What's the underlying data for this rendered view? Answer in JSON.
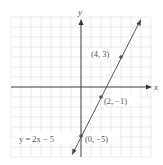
{
  "chart_data": {
    "type": "line",
    "title": "",
    "xlabel": "x",
    "ylabel": "y",
    "xlim": [
      -7,
      7
    ],
    "ylim": [
      -7,
      7
    ],
    "grid": true,
    "series": [
      {
        "name": "y = 2x − 5",
        "equation": "y = 2x − 5",
        "slope": 2,
        "intercept": -5,
        "x": [
          -0.9,
          6
        ],
        "y": [
          -6.8,
          7
        ]
      }
    ],
    "points": [
      {
        "x": 4,
        "y": 3,
        "label": "(4, 3)"
      },
      {
        "x": 2,
        "y": -1,
        "label": "(2, −1)"
      },
      {
        "x": 0,
        "y": -5,
        "label": "(0, −5)"
      }
    ],
    "annotations": [
      {
        "text": "y = 2x − 5",
        "position": "left of (0, −5)"
      }
    ],
    "colors": {
      "line": "#555555",
      "axis": "#444444",
      "grid": "#e6e6e6",
      "text": "#555555"
    }
  },
  "labels": {
    "x_axis": "x",
    "y_axis": "y",
    "p1": "(4, 3)",
    "p2": "(2, −1)",
    "p3": "(0, −5)",
    "equation": "y = 2x − 5"
  }
}
